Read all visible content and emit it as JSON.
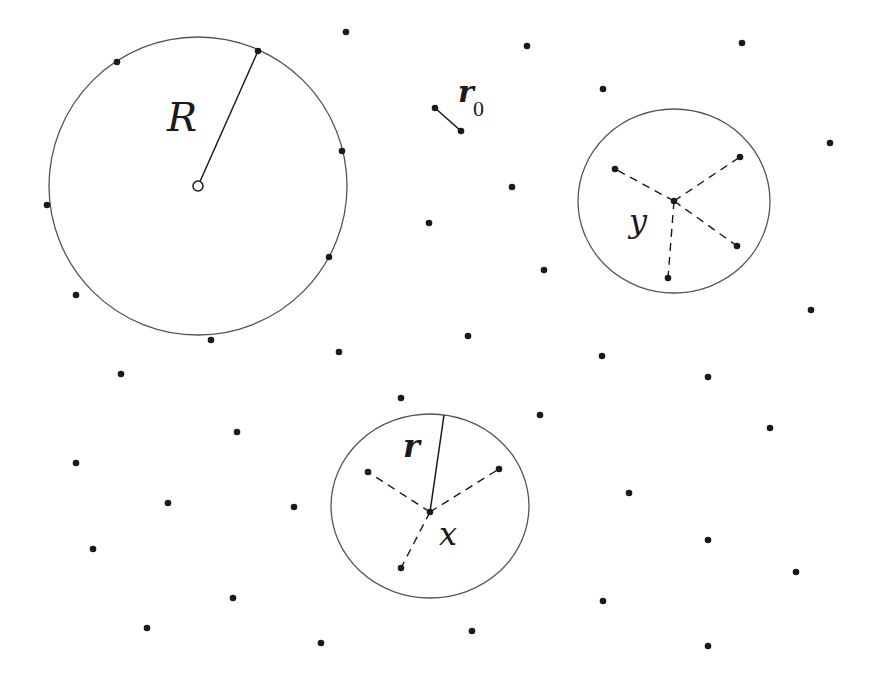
{
  "diagram": {
    "width": 871,
    "height": 676,
    "colors": {
      "ink": "#1a1a1a",
      "circle_stroke": "#555555",
      "background": "#ffffff"
    },
    "large_ball": {
      "label": "R",
      "center": [
        198,
        186
      ],
      "radius": 149,
      "radius_endpoint": [
        258,
        51
      ],
      "label_pos": [
        167,
        131
      ],
      "points_on_boundary": [
        [
          117,
          62
        ],
        [
          258,
          51
        ],
        [
          342,
          151
        ],
        [
          47,
          205
        ],
        [
          329,
          257
        ],
        [
          211,
          340
        ]
      ]
    },
    "r0_segment": {
      "label": "r",
      "subscript": "0",
      "from": [
        435,
        108
      ],
      "to": [
        461,
        131
      ],
      "label_pos": [
        458,
        102
      ],
      "sub_pos": [
        473,
        116
      ]
    },
    "ball_y": {
      "label": "y",
      "center": [
        674,
        201
      ],
      "rx": 96,
      "ry": 92,
      "point": [
        674,
        201
      ],
      "label_pos": [
        629,
        232
      ],
      "neighbors": [
        [
          615,
          169
        ],
        [
          740,
          157
        ],
        [
          737,
          246
        ],
        [
          668,
          278
        ]
      ]
    },
    "ball_x": {
      "label": "x",
      "radius_label": "r",
      "center": [
        430,
        506
      ],
      "rx": 99,
      "ry": 92,
      "point": [
        430,
        512
      ],
      "radius_endpoint": [
        444,
        415
      ],
      "label_pos": [
        439,
        545
      ],
      "radius_label_pos": [
        403,
        457
      ],
      "neighbors": [
        [
          368,
          472
        ],
        [
          499,
          469
        ],
        [
          401,
          568
        ]
      ]
    },
    "scattered_points": [
      [
        346,
        32
      ],
      [
        527,
        46
      ],
      [
        742,
        43
      ],
      [
        603,
        89
      ],
      [
        830,
        143
      ],
      [
        512,
        187
      ],
      [
        429,
        223
      ],
      [
        544,
        270
      ],
      [
        76,
        295
      ],
      [
        811,
        310
      ],
      [
        468,
        336
      ],
      [
        339,
        352
      ],
      [
        602,
        356
      ],
      [
        121,
        374
      ],
      [
        708,
        377
      ],
      [
        401,
        398
      ],
      [
        540,
        415
      ],
      [
        770,
        428
      ],
      [
        237,
        432
      ],
      [
        76,
        463
      ],
      [
        629,
        493
      ],
      [
        168,
        503
      ],
      [
        294,
        507
      ],
      [
        708,
        540
      ],
      [
        93,
        549
      ],
      [
        796,
        572
      ],
      [
        233,
        598
      ],
      [
        603,
        601
      ],
      [
        147,
        628
      ],
      [
        472,
        631
      ],
      [
        321,
        643
      ],
      [
        708,
        646
      ]
    ],
    "point_radius": 3.3
  }
}
